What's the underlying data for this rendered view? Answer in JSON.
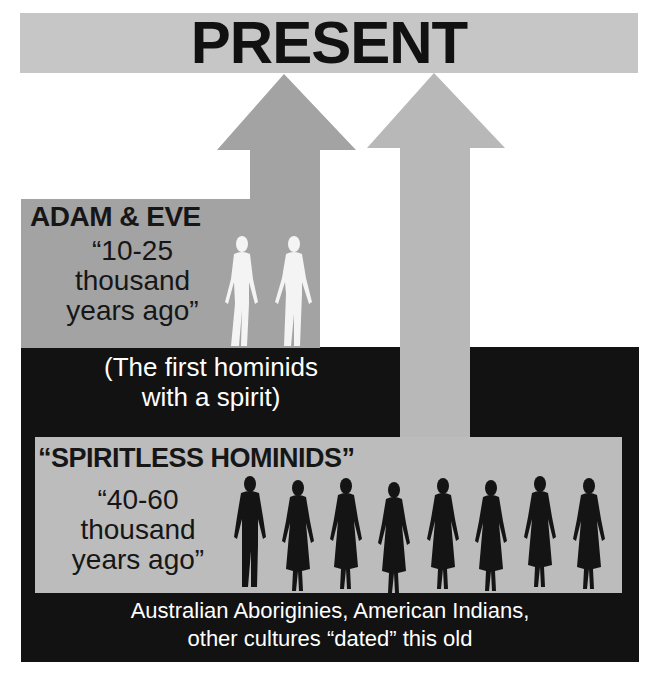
{
  "banner": {
    "title": "PRESENT",
    "color": "#c6c6c6"
  },
  "arrows": [
    {
      "name": "adam-eve-arrow",
      "color": "#a3a3a3"
    },
    {
      "name": "spiritless-arrow",
      "color": "#b8b8b8"
    }
  ],
  "adam_eve": {
    "title": "ADAM & EVE",
    "lines": [
      "“10-25",
      "thousand",
      "years ago”"
    ],
    "note_lines": [
      "(The first hominids",
      "with a spirit)"
    ]
  },
  "spiritless": {
    "title": "“SPIRITLESS HOMINIDS”",
    "lines": [
      "“40-60",
      "thousand",
      "years ago”"
    ],
    "figure_count": 8
  },
  "footer": {
    "lines": [
      "Australian Aboriginies, American Indians,",
      "other cultures “dated” this old"
    ]
  },
  "colors": {
    "black": "#121212",
    "panel_dark": "#a3a3a3",
    "panel_light": "#bcbcbc"
  }
}
